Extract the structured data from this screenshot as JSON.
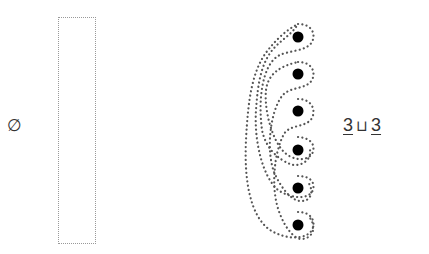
{
  "left": {
    "symbol": "∅",
    "meaning": "empty-set"
  },
  "right_label": {
    "left_operand": "3",
    "operator": "⊔",
    "right_operand": "3"
  },
  "points": {
    "count": 6,
    "x": 298,
    "y": [
      37,
      74,
      111,
      150,
      188,
      225
    ],
    "color": "#000000"
  },
  "colors": {
    "dotted_outline": "#555555",
    "box_outline": "#999999",
    "text": "#333333"
  }
}
